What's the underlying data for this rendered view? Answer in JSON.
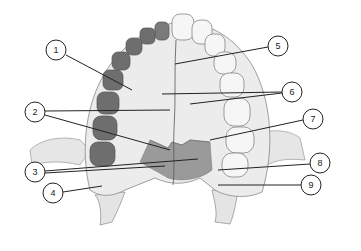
{
  "diagram": {
    "colors": {
      "background": "#ffffff",
      "bone": "#ececec",
      "bone_shade": "#c9c9c9",
      "palatine_shade": "#9a9a9a",
      "tooth": "#f4f4f4",
      "molar_dark": "#6e6e6e",
      "line": "#222222"
    },
    "labels": [
      {
        "num": "1",
        "cx": 56,
        "cy": 50,
        "lines": [
          [
            66,
            55,
            132,
            90
          ]
        ]
      },
      {
        "num": "2",
        "cx": 35,
        "cy": 112,
        "lines": [
          [
            45,
            111,
            170,
            110
          ],
          [
            45,
            115,
            170,
            150
          ]
        ]
      },
      {
        "num": "3",
        "cx": 35,
        "cy": 172,
        "lines": [
          [
            45,
            171,
            198,
            159
          ],
          [
            45,
            173,
            165,
            166
          ]
        ]
      },
      {
        "num": "4",
        "cx": 53,
        "cy": 193,
        "lines": [
          [
            63,
            192,
            102,
            186
          ]
        ]
      },
      {
        "num": "5",
        "cx": 278,
        "cy": 46,
        "lines": [
          [
            268,
            47,
            175,
            64
          ]
        ]
      },
      {
        "num": "6",
        "cx": 292,
        "cy": 92,
        "lines": [
          [
            282,
            92,
            162,
            94
          ],
          [
            282,
            93,
            190,
            104
          ]
        ]
      },
      {
        "num": "7",
        "cx": 313,
        "cy": 119,
        "lines": [
          [
            303,
            120,
            210,
            140
          ]
        ]
      },
      {
        "num": "8",
        "cx": 320,
        "cy": 163,
        "lines": [
          [
            310,
            164,
            218,
            170
          ]
        ]
      },
      {
        "num": "9",
        "cx": 311,
        "cy": 185,
        "lines": [
          [
            301,
            185,
            218,
            185
          ]
        ]
      }
    ]
  }
}
